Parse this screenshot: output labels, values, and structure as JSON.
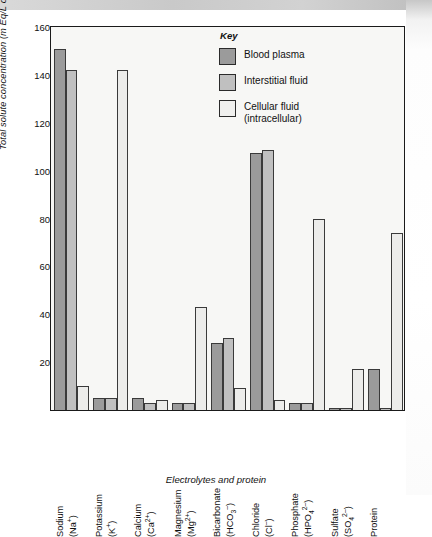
{
  "chart_data": {
    "type": "bar",
    "title": "",
    "xlabel": "Electrolytes and protein",
    "ylabel": "Total solute concentration (m Eq/L of H2O)",
    "ylim": [
      0,
      160
    ],
    "yticks": [
      20,
      40,
      60,
      80,
      100,
      120,
      140,
      160
    ],
    "grid": false,
    "legend_position": "top-right",
    "legend_title": "Key",
    "categories": [
      "Sodium (Na+)",
      "Potassium (K+)",
      "Calcium (Ca2+)",
      "Magnesium (Mg2+)",
      "Bicarbonate (HCO3-)",
      "Chloride (Cl-)",
      "Phosphate (HPO42-)",
      "Sulfate (SO42-)",
      "Protein"
    ],
    "series": [
      {
        "name": "Blood plasma",
        "color": "#9b9b9b",
        "values": [
          151,
          5,
          5,
          3,
          28,
          107.5,
          3,
          1,
          17
        ]
      },
      {
        "name": "Interstitial fluid",
        "color": "#c0c0c0",
        "values": [
          142,
          5,
          3,
          3,
          30,
          108.5,
          3,
          1,
          1
        ]
      },
      {
        "name": "Cellular fluid (intracellular)",
        "color": "#ececea",
        "values": [
          10,
          142,
          4,
          43,
          9,
          4,
          80,
          17,
          74
        ]
      }
    ]
  },
  "axes": {
    "y_title_main": "Total solute concentration (m Eq/L of H",
    "y_title_sub": "2",
    "y_title_end": "O)",
    "x_title": "Electrolytes and protein",
    "ticks": {
      "t20": "20",
      "t40": "40",
      "t60": "60",
      "t80": "80",
      "t100": "100",
      "t120": "120",
      "t140": "140",
      "t160": "160"
    }
  },
  "xlabels": [
    {
      "line1": "Sodium",
      "line2": "(Na",
      "sup": "+",
      "tail": ")"
    },
    {
      "line1": "Potassium",
      "line2": "(K",
      "sup": "+",
      "tail": ")"
    },
    {
      "line1": "Calcium",
      "line2": "(Ca",
      "sup": "2+",
      "tail": ")"
    },
    {
      "line1": "Magnesium",
      "line2": "(Mg",
      "sup": "2+",
      "tail": ")"
    },
    {
      "line1": "Bicarbonate",
      "line2": "(HCO",
      "sub": "3",
      "sup": "–",
      "tail": ")"
    },
    {
      "line1": "Chloride",
      "line2": "(Cl",
      "sup": "–",
      "tail": ")"
    },
    {
      "line1": "Phosphate",
      "line2": "(HPO",
      "sub": "4",
      "sup": "2–",
      "tail": ")"
    },
    {
      "line1": "Sulfate",
      "line2": "(SO",
      "sub": "4",
      "sup": "2–",
      "tail": ")"
    },
    {
      "line1": "Protein",
      "line2": "",
      "sup": "",
      "tail": ""
    }
  ],
  "legend": {
    "title": "Key",
    "items": [
      {
        "label": "Blood plasma",
        "label2": ""
      },
      {
        "label": "Interstitial fluid",
        "label2": ""
      },
      {
        "label": "Cellular fluid",
        "label2": "(intracellular)"
      }
    ]
  }
}
